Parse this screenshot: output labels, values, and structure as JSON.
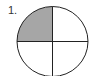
{
  "figure": {
    "label": "1.",
    "shape": "circle",
    "divisions": 4,
    "shaded_parts": 1,
    "shaded_quadrant": "top-left",
    "fraction_shaded": "1/4",
    "colors": {
      "shade": "#a6a6a6",
      "stroke": "#222222",
      "background": "#ffffff"
    }
  }
}
